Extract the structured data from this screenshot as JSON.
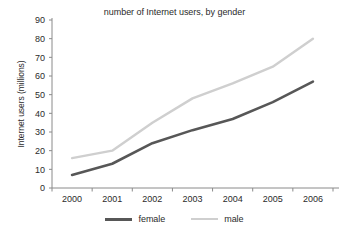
{
  "chart_data": {
    "type": "line",
    "title": "number of Internet users, by gender",
    "xlabel": "",
    "ylabel": "Internet users (millions)",
    "x": [
      "2000",
      "2001",
      "2002",
      "2003",
      "2004",
      "2005",
      "2006"
    ],
    "categories": [
      "2000",
      "2001",
      "2002",
      "2003",
      "2004",
      "2005",
      "2006"
    ],
    "series": [
      {
        "name": "female",
        "color": "#575757",
        "values": [
          7,
          13,
          24,
          31,
          37,
          46,
          57
        ]
      },
      {
        "name": "male",
        "color": "#cfcfcf",
        "values": [
          16,
          20,
          35,
          48,
          56,
          65,
          80
        ]
      }
    ],
    "ylim": [
      0,
      90
    ],
    "yticks": [
      0,
      10,
      20,
      30,
      40,
      50,
      60,
      70,
      80,
      90
    ],
    "ytick_labels": [
      "0",
      "10",
      "20",
      "30",
      "40",
      "50",
      "60",
      "70",
      "80",
      "90"
    ],
    "xtick_labels": [
      "2000",
      "2001",
      "2002",
      "2003",
      "2004",
      "2005",
      "2006"
    ],
    "grid": false,
    "legend_position": "bottom",
    "axis_color": "#8a8a8a",
    "background": "#ffffff"
  },
  "legend": {
    "items": [
      {
        "label": "female",
        "color": "#575757"
      },
      {
        "label": "male",
        "color": "#cfcfcf"
      }
    ]
  }
}
